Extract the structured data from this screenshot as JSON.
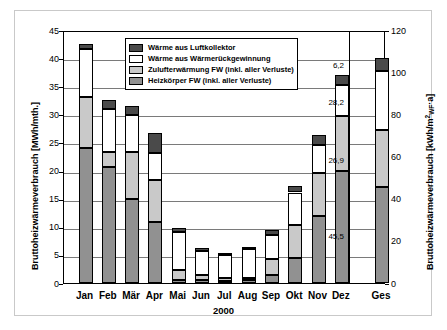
{
  "chart_data": {
    "type": "bar",
    "stacked": true,
    "title": "",
    "xlabel": "2000",
    "ylabel": "Bruttoheizwärmeverbrauch [MWh/mth.]",
    "y2label": "Bruttoheizwärmeverbrauch [kWh/m²WF·a]",
    "categories": [
      "Jan",
      "Feb",
      "Mär",
      "Apr",
      "Mai",
      "Jun",
      "Jul",
      "Aug",
      "Sep",
      "Okt",
      "Nov",
      "Dez",
      "Ges"
    ],
    "ylim": [
      0,
      45
    ],
    "yticks": [
      0,
      5,
      10,
      15,
      20,
      25,
      30,
      35,
      40,
      45
    ],
    "y2lim": [
      0,
      120
    ],
    "y2ticks": [
      0,
      20,
      40,
      60,
      80,
      100,
      120
    ],
    "grid": true,
    "legend_position": "top-center",
    "series": [
      {
        "name": "Heizkörper FW (inkl. aller Verluste)",
        "color": "#919191",
        "values": [
          24.0,
          20.7,
          15.0,
          10.8,
          0.6,
          0.5,
          0.4,
          0.5,
          1.4,
          4.5,
          11.9,
          20.0,
          45.5
        ]
      },
      {
        "name": "Zulufterwärmung FW (inkl. aller Verluste)",
        "color": "#c9c9c9",
        "values": [
          9.1,
          2.6,
          8.3,
          7.5,
          1.7,
          1.0,
          0.5,
          0.4,
          2.8,
          5.8,
          7.7,
          9.7,
          26.9
        ]
      },
      {
        "name": "Wärme aus Wärmerückgewinnung",
        "color": "#ffffff",
        "values": [
          8.5,
          7.7,
          6.5,
          4.9,
          6.7,
          4.2,
          4.0,
          5.2,
          4.3,
          5.8,
          5.0,
          5.5,
          28.2
        ]
      },
      {
        "name": "Wärme aus Luftkollektor",
        "color": "#4a4a4a",
        "values": [
          0.9,
          1.5,
          1.7,
          3.5,
          0.8,
          0.6,
          0.5,
          0.2,
          1.0,
          1.1,
          1.7,
          1.8,
          6.2
        ]
      }
    ],
    "totals": [
      42.5,
      40.2,
      31.5,
      26.7,
      9.8,
      6.3,
      5.4,
      6.3,
      9.5,
      17.2,
      26.3,
      37.0,
      106.8
    ],
    "annotations": [
      {
        "label": "6,2",
        "value": 6.2,
        "series": "Wärme aus Luftkollektor"
      },
      {
        "label": "28,2",
        "value": 28.2,
        "series": "Wärme aus Wärmerückgewinnung"
      },
      {
        "label": "26,9",
        "value": 26.9,
        "series": "Zulufterwärmung FW (inkl. aller Verluste)"
      },
      {
        "label": "45,5",
        "value": 45.5,
        "series": "Heizkörper FW (inkl. aller Verluste)"
      }
    ]
  },
  "axes": {
    "left": {
      "title_main": "Bruttoheizwärmeverbrauch [MWh/mth.]",
      "ticks": [
        "0",
        "5",
        "10",
        "15",
        "20",
        "25",
        "30",
        "35",
        "40",
        "45"
      ]
    },
    "right": {
      "title_prefix": "Bruttoheizwärmeverbrauch [kWh/m",
      "title_sup": "2",
      "title_sub": "WF",
      "title_suffix": "·a]",
      "ticks": [
        "0",
        "20",
        "40",
        "60",
        "80",
        "100",
        "120"
      ]
    },
    "x": {
      "title": "2000",
      "categories": [
        "Jan",
        "Feb",
        "Mär",
        "Apr",
        "Mai",
        "Jun",
        "Jul",
        "Aug",
        "Sep",
        "Okt",
        "Nov",
        "Dez",
        "Ges"
      ]
    }
  },
  "legend": {
    "items": [
      {
        "label": "Wärme aus Luftkollektor",
        "color": "#4a4a4a"
      },
      {
        "label": "Wärme aus Wärmerückgewinnung",
        "color": "#ffffff"
      },
      {
        "label": "Zulufterwärmung FW (inkl. aller Verluste)",
        "color": "#c9c9c9"
      },
      {
        "label": "Heizkörper FW (inkl. aller Verluste)",
        "color": "#919191"
      }
    ]
  }
}
